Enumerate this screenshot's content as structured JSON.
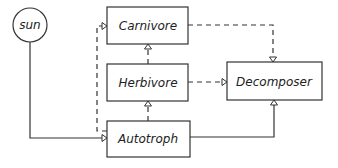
{
  "diagram": {
    "nodes": {
      "sun": {
        "label": "sun",
        "shape": "circle"
      },
      "carnivore": {
        "label": "Carnivore",
        "shape": "rect"
      },
      "herbivore": {
        "label": "Herbivore",
        "shape": "rect"
      },
      "autotroph": {
        "label": "Autotroph",
        "shape": "rect"
      },
      "decomposer": {
        "label": "Decomposer",
        "shape": "rect"
      }
    },
    "edges": [
      {
        "from": "sun",
        "to": "autotroph",
        "style": "solid"
      },
      {
        "from": "autotroph",
        "to": "herbivore",
        "style": "dashed"
      },
      {
        "from": "herbivore",
        "to": "carnivore",
        "style": "dashed"
      },
      {
        "from": "autotroph",
        "to": "carnivore",
        "style": "dashed"
      },
      {
        "from": "carnivore",
        "to": "decomposer",
        "style": "dashed"
      },
      {
        "from": "herbivore",
        "to": "decomposer",
        "style": "dashed"
      },
      {
        "from": "autotroph",
        "to": "decomposer",
        "style": "solid"
      }
    ]
  }
}
